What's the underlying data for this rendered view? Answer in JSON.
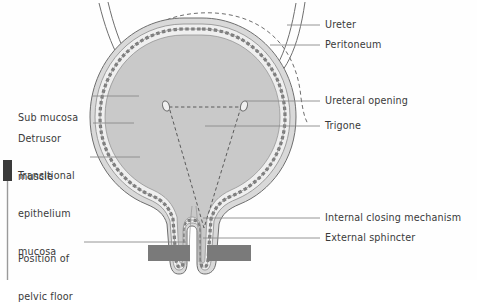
{
  "figure": {
    "background_color": "#fefefe",
    "ink_color": "#3a3a3a"
  },
  "colors": {
    "lumen_fill": "#c9c9c9",
    "muscle_fill": "#d9d9d9",
    "submucosa_fill": "#efefef",
    "outline": "#6e6e6e",
    "leader_line": "#8a8a8a",
    "pelvic_floor": "#7a7a7a",
    "dark_bar": "#3a3a3a",
    "text": "#3a3a3a"
  },
  "labels_left": [
    {
      "id": "sub-mucosa",
      "text": "Sub mucosa",
      "x": 18,
      "y": 93,
      "lines": [
        "Sub mucosa"
      ]
    },
    {
      "id": "detrusor",
      "text": "Detrusor muscle",
      "x": 18,
      "y": 114,
      "lines": [
        "Detrusor",
        "muscle"
      ]
    },
    {
      "id": "transitional",
      "text": "Transitional epithelium mucosa",
      "x": 18,
      "y": 151,
      "lines": [
        "Transitional",
        "epithelium",
        "mucosa"
      ]
    },
    {
      "id": "pelvic-floor",
      "text": "Position of pelvic floor",
      "x": 18,
      "y": 233,
      "lines": [
        "Position of",
        "pelvic floor"
      ]
    }
  ],
  "labels_right": [
    {
      "id": "ureter",
      "text": "Ureter",
      "x": 325,
      "y": 21
    },
    {
      "id": "peritoneum",
      "text": "Peritoneum",
      "x": 325,
      "y": 41
    },
    {
      "id": "ureteral-opening",
      "text": "Ureteral opening",
      "x": 325,
      "y": 97
    },
    {
      "id": "trigone",
      "text": "Trigone",
      "x": 325,
      "y": 122
    },
    {
      "id": "internal-closing",
      "text": "Internal closing mechanism",
      "x": 325,
      "y": 214
    },
    {
      "id": "external-sphincter",
      "text": "External sphincter",
      "x": 325,
      "y": 234
    }
  ],
  "anatomy_parts": [
    "ureter",
    "peritoneum",
    "ureteral opening",
    "trigone",
    "internal closing mechanism",
    "external sphincter",
    "sub mucosa",
    "detrusor muscle",
    "transitional epithelium mucosa",
    "position of pelvic floor"
  ]
}
